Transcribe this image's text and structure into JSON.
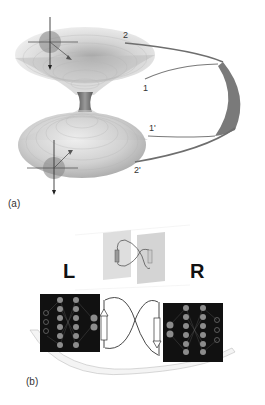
{
  "figure": {
    "panel_a": {
      "label": "(a)",
      "description": "Wormhole surface with two mouths connected by ribbon",
      "endpoint_labels": {
        "top_outer": "2",
        "top_inner": "1",
        "bottom_inner": "1'",
        "bottom_outer": "2'"
      }
    },
    "panel_b": {
      "label": "(b)",
      "left_label": "L",
      "right_label": "R",
      "description": "Two neural networks connected by entangled links and a shared arc"
    }
  },
  "colors": {
    "background": "#ffffff",
    "surface": "#c8c8c8",
    "throat": "#777777",
    "ribbon": "#6e6e6e",
    "ribbon_fill": "#7a7a7a",
    "network_bg": "#111111",
    "node": "#8c8c8c",
    "plane": "#d9d9d9"
  }
}
